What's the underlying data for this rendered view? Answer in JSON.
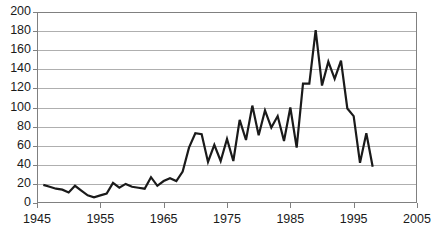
{
  "chart_data": {
    "type": "line",
    "title": "",
    "subtitle": "",
    "xlabel": "",
    "ylabel": "",
    "xlim": [
      1945,
      2005
    ],
    "ylim": [
      0,
      200
    ],
    "grid": true,
    "grid_axis": "y",
    "legend": null,
    "legend_position": "none",
    "x_ticks": [
      1945,
      1955,
      1965,
      1975,
      1985,
      1995,
      2005
    ],
    "x_tick_labels": [
      "1945",
      "1955",
      "1965",
      "1975",
      "1985",
      "1995",
      "2005"
    ],
    "y_ticks": [
      0,
      20,
      40,
      60,
      80,
      100,
      120,
      140,
      160,
      180,
      200
    ],
    "y_tick_labels": [
      "0",
      "20",
      "40",
      "60",
      "80",
      "100",
      "120",
      "140",
      "160",
      "180",
      "200"
    ],
    "series": [
      {
        "name": "",
        "color": "#1a1a1a",
        "line_width": 2.2,
        "x": [
          1946,
          1947,
          1948,
          1949,
          1950,
          1951,
          1952,
          1953,
          1954,
          1955,
          1956,
          1957,
          1958,
          1959,
          1960,
          1961,
          1962,
          1963,
          1964,
          1965,
          1966,
          1967,
          1968,
          1969,
          1970,
          1971,
          1972,
          1973,
          1974,
          1975,
          1976,
          1977,
          1978,
          1979,
          1980,
          1981,
          1982,
          1983,
          1984,
          1985,
          1986,
          1987,
          1988,
          1989,
          1990,
          1991,
          1992,
          1993,
          1994,
          1995,
          1996,
          1997,
          1998
        ],
        "y": [
          19,
          17,
          15,
          14,
          11,
          18,
          13,
          8,
          6,
          8,
          10,
          21,
          16,
          20,
          17,
          16,
          15,
          27,
          18,
          23,
          26,
          23,
          33,
          58,
          73,
          72,
          43,
          61,
          44,
          67,
          44,
          87,
          66,
          102,
          71,
          97,
          79,
          91,
          65,
          100,
          58,
          125,
          125,
          181,
          123,
          148,
          130,
          149,
          99,
          91,
          42,
          73,
          38
        ]
      }
    ]
  },
  "axes": {
    "plot_left_px": 37,
    "plot_right_px": 417,
    "plot_top_px": 12,
    "plot_bottom_px": 203,
    "border_color": "#808080",
    "gridline_color": "#9a9a9a",
    "background": "#ffffff"
  }
}
